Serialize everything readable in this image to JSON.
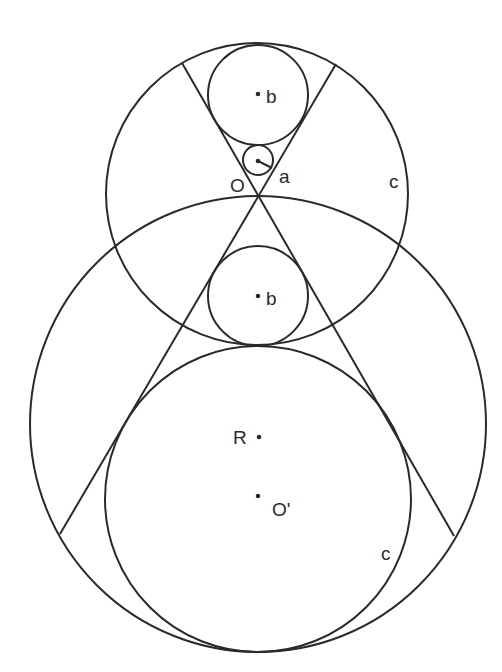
{
  "diagram": {
    "stroke_color": "#2a2a2a",
    "circles": [
      {
        "id": "top-c",
        "cx": 257,
        "cy": 194,
        "r": 151
      },
      {
        "id": "big",
        "cx": 258,
        "cy": 424,
        "r": 228
      },
      {
        "id": "lower-c",
        "cx": 258,
        "cy": 499,
        "r": 153
      },
      {
        "id": "upper-b",
        "cx": 258,
        "cy": 95,
        "r": 50
      },
      {
        "id": "lower-b",
        "cx": 258,
        "cy": 296,
        "r": 50
      },
      {
        "id": "a",
        "cx": 258,
        "cy": 160,
        "r": 15
      }
    ],
    "lines": [
      {
        "x1": 182,
        "y1": 63,
        "x2": 454,
        "y2": 536
      },
      {
        "x1": 336,
        "y1": 64,
        "x2": 60,
        "y2": 534
      },
      {
        "x1": 258,
        "y1": 161,
        "x2": 272,
        "y2": 168
      }
    ],
    "points": [
      {
        "cx": 258,
        "cy": 94
      },
      {
        "cx": 258,
        "cy": 296
      },
      {
        "cx": 259,
        "cy": 437
      },
      {
        "cx": 258,
        "cy": 496
      }
    ],
    "labels": {
      "b_upper": "b",
      "a": "a",
      "O": "O",
      "c_upper": "c",
      "b_lower": "b",
      "R": "R",
      "O_prime": "O'",
      "c_lower": "c"
    }
  }
}
